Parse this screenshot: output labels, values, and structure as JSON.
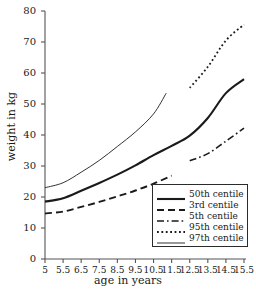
{
  "chart_data": {
    "type": "line",
    "title": "",
    "xlabel": "age in years",
    "ylabel": "weight in kg",
    "xlim": [
      5,
      15.5
    ],
    "ylim": [
      0,
      80
    ],
    "grid": false,
    "legend_position": "inside-lower-right",
    "x_ticks": [
      "5",
      "5.5",
      "6.5",
      "7.5",
      "8.5",
      "9.5",
      "10.5",
      "11.5",
      "12.5",
      "13.5",
      "14.5",
      "15.5"
    ],
    "x_tick_values": [
      5,
      5.5,
      6.5,
      7.5,
      8.5,
      9.5,
      10.5,
      11.5,
      12.5,
      13.5,
      14.5,
      15.5
    ],
    "y_ticks": [
      "0",
      "10",
      "20",
      "30",
      "40",
      "50",
      "60",
      "70",
      "80"
    ],
    "y_tick_values": [
      0,
      10,
      20,
      30,
      40,
      50,
      60,
      70,
      80
    ],
    "series": [
      {
        "name": "50th centile",
        "style": "solid-thick",
        "color": "#1a1a1a",
        "x": [
          5,
          5.5,
          6.5,
          7.5,
          8.5,
          9.5,
          10.5,
          11.5,
          12.5,
          13.5,
          14.5,
          15.5
        ],
        "y": [
          18.5,
          19.6,
          22.0,
          24.5,
          27.2,
          30.2,
          33.5,
          36.5,
          39.8,
          45.5,
          53.5,
          58.0
        ]
      },
      {
        "name": "3rd centile",
        "style": "dashed",
        "color": "#1a1a1a",
        "x": [
          5,
          5.5,
          6.5,
          7.5,
          8.5,
          9.5,
          10.5,
          11.5
        ],
        "y": [
          14.7,
          15.3,
          16.8,
          18.4,
          20.2,
          22.1,
          24.3,
          26.9
        ]
      },
      {
        "name": "5th centile",
        "style": "dash-dot",
        "color": "#1a1a1a",
        "x": [
          12.5,
          13.5,
          14.5,
          15.5
        ],
        "y": [
          31.7,
          34.0,
          38.0,
          42.2
        ]
      },
      {
        "name": "95th centile",
        "style": "dotted",
        "color": "#1a1a1a",
        "x": [
          12.5,
          13.5,
          14.5,
          15.5
        ],
        "y": [
          55.2,
          62.0,
          70.5,
          75.6
        ]
      },
      {
        "name": "97th centile",
        "style": "solid-thin",
        "color": "#1a1a1a",
        "x": [
          5,
          5.5,
          6.5,
          7.5,
          8.5,
          9.5,
          10.5,
          11.2
        ],
        "y": [
          23.0,
          24.6,
          28.0,
          31.8,
          36.3,
          41.0,
          46.8,
          53.5
        ]
      }
    ]
  },
  "axes": {
    "x_label": "age in years",
    "y_label": "weight in kg"
  },
  "legend": {
    "entries": [
      {
        "label": "50th centile",
        "style": "solid-thick"
      },
      {
        "label": "3rd centile",
        "style": "dashed"
      },
      {
        "label": "5th centile",
        "style": "dash-dot"
      },
      {
        "label": "95th centile",
        "style": "dotted"
      },
      {
        "label": "97th centile",
        "style": "solid-thin"
      }
    ]
  },
  "colors": {
    "ink": "#1a1a1a",
    "axis": "#555555",
    "background": "#ffffff"
  }
}
